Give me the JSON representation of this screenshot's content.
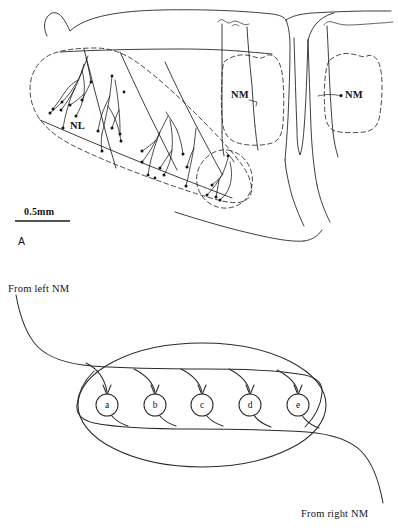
{
  "figure": {
    "type": "two-panel scientific line drawing",
    "panel_a": {
      "label": "A",
      "label_nl": "NL",
      "label_nm_left": "NM",
      "label_nm_right": "NM",
      "scale_bar_text": "0.5mm",
      "description": "Camera lucida reconstruction of labeled axonal arbors in the avian auditory brainstem showing nucleus laminaris (NL) and two nucleus magnocellularis (NM) regions outlined with dashed borders."
    },
    "panel_b": {
      "label_nl": "NL",
      "input_left": "From left NM",
      "input_right": "From right NM",
      "nodes": [
        {
          "id": "a",
          "cx": 107,
          "cy": 140
        },
        {
          "id": "b",
          "cx": 155,
          "cy": 140
        },
        {
          "id": "c",
          "cx": 202,
          "cy": 140
        },
        {
          "id": "d",
          "cx": 250,
          "cy": 140
        },
        {
          "id": "e",
          "cx": 298,
          "cy": 140
        }
      ],
      "description": "Schematic delay-line circuit: an axon from the left NM travels along the top of the NL oval giving descending branches, while an axon from the right NM travels along the bottom giving ascending branches, onto five NL neurons a-e."
    }
  },
  "colors": {
    "ink": "#1b1b1b",
    "schematic": "#2a2a2a",
    "background": "#ffffff"
  }
}
